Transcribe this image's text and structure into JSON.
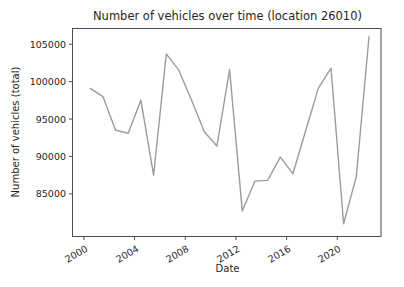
{
  "chart_data": {
    "type": "line",
    "title": "Number of vehicles over time (location 26010)",
    "xlabel": "Date",
    "ylabel": "Number of vehicles (total)",
    "years": [
      2000,
      2001,
      2002,
      2003,
      2004,
      2005,
      2006,
      2007,
      2008,
      2009,
      2010,
      2011,
      2012,
      2013,
      2014,
      2015,
      2016,
      2017,
      2018,
      2019,
      2020,
      2021,
      2022
    ],
    "values": [
      99100,
      98000,
      93500,
      93100,
      97500,
      87500,
      103700,
      101500,
      97500,
      93300,
      91400,
      101600,
      82700,
      86700,
      86800,
      89900,
      87700,
      93400,
      99100,
      101800,
      81000,
      87300,
      106000
    ],
    "xticks": [
      2000,
      2004,
      2008,
      2012,
      2016,
      2020
    ],
    "yticks": [
      85000,
      90000,
      95000,
      100000,
      105000
    ],
    "xlim": [
      1999.1,
      2023.45
    ],
    "ylim": [
      79300,
      107100
    ],
    "x_plot_offset": 0.5,
    "xtick_rotation_deg": 30,
    "grid": false,
    "legend": null,
    "line_color": "#9c9c9c",
    "spine_color": "#4d4d4d",
    "tick_color": "#4d4d4d",
    "text_color": "#262626"
  }
}
